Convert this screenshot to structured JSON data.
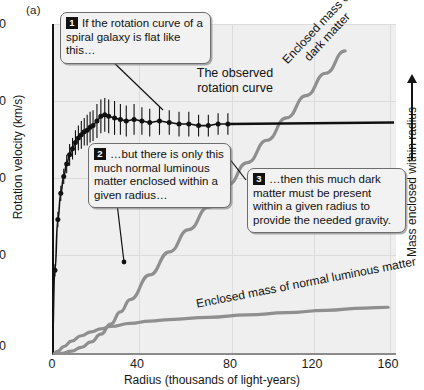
{
  "figure": {
    "panel_label": "(a)",
    "xaxis": {
      "title": "Radius (thousands of light-years)",
      "ticks": [
        0,
        40,
        80,
        120,
        160
      ],
      "min": 0,
      "max": 175
    },
    "yaxis": {
      "title": "Rotation velocity (km/s)",
      "ticks": [
        0,
        50,
        100,
        150,
        200
      ],
      "min": 0,
      "max": 215
    },
    "yaxis_right": {
      "title": "Mass enclosed within radius",
      "arrow": "up-arrow-icon"
    },
    "labels": {
      "observed_curve": "The observed rotation curve",
      "dark_matter": "Enclosed mass of dark matter",
      "luminous_matter": "Enclosed mass of normal luminous matter"
    },
    "callouts": [
      {
        "number": "1",
        "text": "If the rotation curve of a spiral galaxy is flat like this…"
      },
      {
        "number": "2",
        "text": "…but there is only this much normal luminous matter enclosed within a given radius…"
      },
      {
        "number": "3",
        "text": "…then this much dark matter must be present within a given radius to provide the needed gravity."
      }
    ],
    "colors": {
      "plot_background": "#efefef",
      "data_curve": "#111111",
      "mass_curves": "#8f8f8f",
      "gridlines": "#dcdcdc",
      "callout_fill": "#f2f2f2",
      "callout_border": "#6d6d6d"
    }
  },
  "chart_data": {
    "type": "line",
    "title": "",
    "xlabel": "Radius (thousands of light-years)",
    "ylabel": "Rotation velocity (km/s)",
    "ylabel_right": "Mass enclosed within radius",
    "xlim": [
      0,
      175
    ],
    "ylim": [
      0,
      215
    ],
    "xticks": [
      0,
      40,
      80,
      120,
      160
    ],
    "yticks": [
      0,
      50,
      100,
      150,
      200
    ],
    "grid": true,
    "legend": "none (in-plot annotations)",
    "series": [
      {
        "name": "The observed rotation curve",
        "type": "scatter-with-errorbars",
        "color": "#111111",
        "x": [
          1.5,
          3,
          4.5,
          6,
          7.5,
          9,
          10.5,
          12,
          13.5,
          15,
          16.5,
          18,
          19.5,
          21,
          23,
          25,
          27,
          29,
          32,
          35,
          38,
          42,
          46,
          50,
          55,
          60,
          65,
          70,
          75,
          80,
          85,
          90
        ],
        "y": [
          55,
          88,
          105,
          116,
          124,
          130,
          134,
          138,
          141,
          143,
          145,
          146,
          148,
          149,
          152,
          155,
          156,
          155,
          154,
          153,
          152,
          153,
          152,
          151,
          152,
          151,
          150,
          150,
          149,
          149,
          150,
          150
        ],
        "yerr": [
          4,
          5,
          5,
          5,
          6,
          7,
          7,
          8,
          8,
          9,
          9,
          10,
          10,
          10,
          11,
          11,
          11,
          11,
          11,
          10,
          10,
          10,
          9,
          9,
          9,
          8,
          8,
          8,
          7,
          7,
          7,
          7
        ]
      },
      {
        "name": "Flat extrapolation of rotation curve",
        "type": "line",
        "color": "#111111",
        "x": [
          90,
          175
        ],
        "y": [
          150,
          151
        ]
      },
      {
        "name": "Enclosed mass of dark matter",
        "type": "line",
        "color": "#8f8f8f",
        "x": [
          0,
          5,
          10,
          15,
          20,
          25,
          30,
          35,
          40,
          50,
          60,
          70,
          80,
          90,
          100,
          110,
          120,
          130,
          140,
          150
        ],
        "y": [
          0,
          2,
          5,
          10,
          17,
          27,
          40,
          56,
          72,
          104,
          134,
          163,
          192,
          221,
          250,
          279,
          308,
          337,
          366,
          395
        ]
      },
      {
        "name": "Enclosed mass of normal luminous matter",
        "type": "line",
        "color": "#8f8f8f",
        "x": [
          0,
          3,
          6,
          10,
          15,
          20,
          25,
          30,
          40,
          50,
          60,
          80,
          100,
          120,
          140,
          160,
          172
        ],
        "y": [
          0,
          5,
          11,
          18,
          25,
          30,
          34,
          37,
          41,
          44,
          46,
          49,
          52,
          55,
          58,
          61,
          62
        ]
      }
    ],
    "annotations": [
      {
        "id": "1",
        "text": "If the rotation curve of a spiral galaxy is flat like this…",
        "points_to": "observed rotation curve plateau"
      },
      {
        "id": "2",
        "text": "…but there is only this much normal luminous matter enclosed within a given radius…",
        "points_to": "luminous matter curve"
      },
      {
        "id": "3",
        "text": "…then this much dark matter must be present within a given radius to provide the needed gravity.",
        "points_to": "dark matter curve"
      }
    ]
  }
}
